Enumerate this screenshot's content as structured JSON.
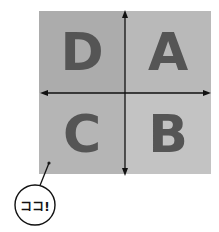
{
  "quadrants": [
    {
      "id": "D",
      "label": "D",
      "position": "top-left",
      "color": "#acacac"
    },
    {
      "id": "A",
      "label": "A",
      "position": "top-right",
      "color": "#b9b9b9"
    },
    {
      "id": "C",
      "label": "C",
      "position": "bottom-left",
      "color": "#b5b5b5"
    },
    {
      "id": "B",
      "label": "B",
      "position": "bottom-right",
      "color": "#c3c3c3"
    }
  ],
  "axes": {
    "color": "#111111",
    "horizontal": "double-arrow",
    "vertical": "double-arrow"
  },
  "callout": {
    "text": "ココ!",
    "target_quadrant": "C"
  },
  "colors": {
    "letter": "#555555",
    "background": "#ffffff"
  }
}
